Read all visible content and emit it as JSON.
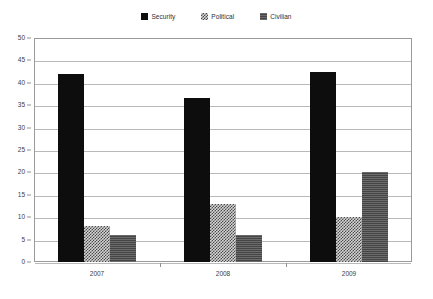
{
  "chart_data": {
    "type": "bar",
    "title": "",
    "subtitle": "",
    "xlabel": "",
    "ylabel": "",
    "categories": [
      "2007",
      "2008",
      "2009"
    ],
    "series": [
      {
        "name": "Security",
        "values": [
          42,
          36.5,
          42.5
        ],
        "pattern": "solid-black",
        "color": "#0d0d0d"
      },
      {
        "name": "Political",
        "values": [
          8,
          13,
          10
        ],
        "pattern": "checkered-light",
        "color": "#d4d4d4"
      },
      {
        "name": "Civilian",
        "values": [
          6,
          6,
          20
        ],
        "pattern": "horizontal-lines",
        "color": "#5d5d5d"
      }
    ],
    "ylim": [
      0,
      50
    ],
    "ytick_step": 5,
    "yticks": [
      0,
      5,
      10,
      15,
      20,
      25,
      30,
      35,
      40,
      45,
      50
    ],
    "ytick_labels": [
      "0",
      "5",
      "10",
      "15",
      "20",
      "25",
      "30",
      "35",
      "40",
      "45",
      "50"
    ],
    "grid": true,
    "grid_axis": "y",
    "legend_position": "top-center",
    "plot_border_color": "#9a9a9a",
    "gridline_color": "#b9b9b9",
    "background_color": "#ffffff"
  },
  "legend": {
    "items": [
      {
        "label": "Security",
        "swatch": "legend-swatch-security"
      },
      {
        "label": "Political",
        "swatch": "legend-swatch-political"
      },
      {
        "label": "Civilian",
        "swatch": "legend-swatch-civilian"
      }
    ]
  }
}
